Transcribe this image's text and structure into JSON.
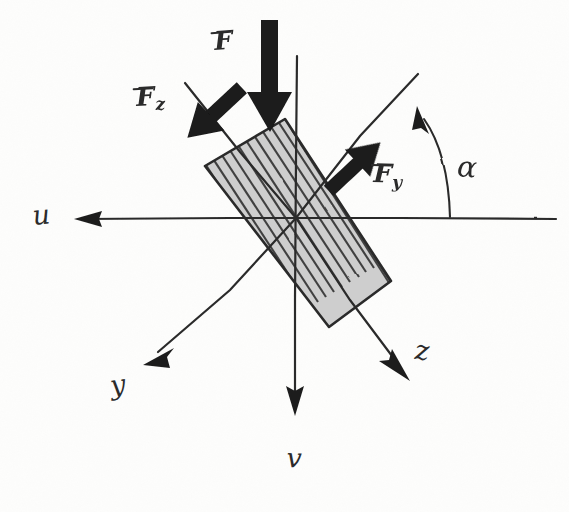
{
  "diagram": {
    "ink_color": "#2b2b2b",
    "paper_color": "#fdfdfc",
    "body_fill": "#b8b8b8",
    "arrow_fill": "#1a1a1a"
  },
  "axes": [
    {
      "id": "u",
      "label": "u",
      "label_x": 34,
      "label_y": 206,
      "direction": "left",
      "from_x": 555,
      "from_y": 218,
      "to_x": 80,
      "to_y": 218
    },
    {
      "id": "v",
      "label": "v",
      "label_x": 286,
      "label_y": 448,
      "direction": "down",
      "from_x": 296,
      "from_y": 56,
      "to_x": 295,
      "to_y": 412
    },
    {
      "id": "y",
      "label": "y",
      "label_x": 112,
      "label_y": 378,
      "direction": "down-left",
      "from_x": 417,
      "from_y": 75,
      "to_x": 150,
      "to_y": 358
    },
    {
      "id": "z",
      "label": "z",
      "label_x": 414,
      "label_y": 341,
      "direction": "down-right",
      "from_x": 185,
      "from_y": 83,
      "to_x": 406,
      "to_y": 372
    }
  ],
  "forces": [
    {
      "id": "F",
      "label": "F",
      "subscript": "",
      "label_x": 215,
      "label_y": 33,
      "tail_x": 270,
      "tail_y": 22,
      "tip_x": 270,
      "tip_y": 131,
      "style": "thick-vertical"
    },
    {
      "id": "Fz",
      "label": "F",
      "subscript": "z",
      "label_x": 137,
      "label_y": 88,
      "tail_x": 198,
      "tail_y": 84,
      "tip_x": 240,
      "tip_y": 140,
      "style": "thick-diagonal"
    },
    {
      "id": "Fy",
      "label": "F",
      "subscript": "y",
      "label_x": 373,
      "label_y": 163,
      "tail_x": 379,
      "tail_y": 143,
      "tip_x": 325,
      "tip_y": 194,
      "style": "thick-diagonal"
    }
  ],
  "angle": {
    "id": "alpha",
    "label": "α",
    "label_x": 456,
    "label_y": 155,
    "arc_base_x": 450,
    "arc_base_y": 216,
    "arc_tip_x": 419,
    "arc_tip_y": 112,
    "between": [
      "u",
      "y"
    ]
  },
  "body": {
    "id": "hatched-plate",
    "shape": "rotated-rectangle",
    "rotation_deg": 52,
    "corners": [
      {
        "x": 205,
        "y": 166
      },
      {
        "x": 285,
        "y": 119
      },
      {
        "x": 391,
        "y": 281
      },
      {
        "x": 329,
        "y": 327
      }
    ],
    "hatch_spacing": 9,
    "hatch_direction": "long-axis"
  }
}
